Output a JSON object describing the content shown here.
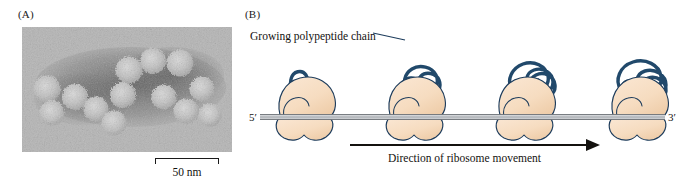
{
  "figure": {
    "panels": [
      {
        "id": "A",
        "label": "(A)"
      },
      {
        "id": "B",
        "label": "(B)"
      }
    ]
  },
  "panel_a": {
    "label": "(A)",
    "content_description": "electron-micrograph-of-polyribosome",
    "scalebar": {
      "text": "50 nm",
      "value": 50,
      "unit": "nm"
    }
  },
  "panel_b": {
    "label": "(B)",
    "chain_caption": "Growing polypeptide chain",
    "movement_caption": "Direction of ribosome movement",
    "mrna": {
      "five_prime_label": "5′",
      "three_prime_label": "3′"
    },
    "ribosome_count": 4
  },
  "colors": {
    "ribosome_fill": "#f6dcc0",
    "ribosome_fill_shadow": "#eccba6",
    "ribosome_outline": "#1d3c5c",
    "polypeptide": "#21496b",
    "mrna_light": "#b9bcc0",
    "mrna_dark": "#6f7479",
    "text": "#14120f",
    "background": "#ffffff"
  }
}
